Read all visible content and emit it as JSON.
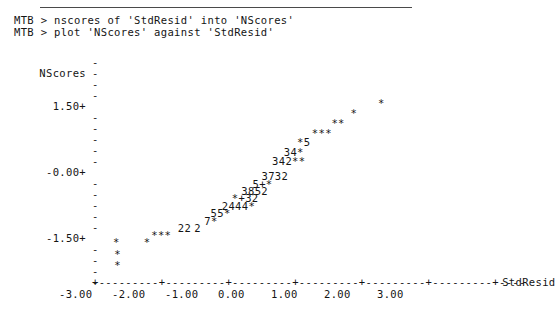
{
  "window": {
    "app": "minitab-session",
    "background": "#ffffff",
    "foreground": "#141414"
  },
  "session": {
    "prompt": "MTB >",
    "commands": [
      "MTB > nscores of 'StdResid' into 'NScores'",
      "MTB > plot 'NScores' against 'StdResid'"
    ]
  },
  "chart_data": {
    "type": "scatter",
    "title": "",
    "subtitle": "",
    "xlabel": "StdResid",
    "ylabel": "NScores",
    "grid": false,
    "legend": null,
    "xlim": [
      -3.0,
      3.5
    ],
    "ylim": [
      -2.4,
      2.5
    ],
    "xticks": [
      "-3.00",
      "-2.00",
      "-1.00",
      "0.00",
      "1.00",
      "2.00",
      "3.00"
    ],
    "xtick_values": [
      -3.0,
      -2.0,
      -1.0,
      0.0,
      1.0,
      2.0,
      3.0
    ],
    "yticks": [
      "1.50+",
      "-0.00+",
      "-1.50+"
    ],
    "ytick_values": [
      1.5,
      0.0,
      -1.5
    ],
    "y_minor_tick_glyph": "-",
    "x_axis_tick_glyph": "+",
    "x_axis_fill_glyph": "-",
    "point_glyph": "*",
    "overplot_note": "digits indicate number of coincident points; '+' indicates 10 or more",
    "markers": [
      {
        "label": "*",
        "x": -2.28,
        "y": -2.25
      },
      {
        "label": "*",
        "x": -2.28,
        "y": -2.0
      },
      {
        "label": "*",
        "x": -2.3,
        "y": -1.73
      },
      {
        "label": "*",
        "x": -1.72,
        "y": -1.73
      },
      {
        "label": "***",
        "x": -1.58,
        "y": -1.56
      },
      {
        "label": "22",
        "x": -1.08,
        "y": -1.4
      },
      {
        "label": "2",
        "x": -0.77,
        "y": -1.4
      },
      {
        "label": "7*",
        "x": -0.58,
        "y": -1.22
      },
      {
        "label": "55*",
        "x": -0.46,
        "y": -1.05
      },
      {
        "label": "2444*",
        "x": -0.25,
        "y": -0.87
      },
      {
        "label": "*+32",
        "x": -0.06,
        "y": -0.7
      },
      {
        "label": "3852",
        "x": 0.12,
        "y": -0.52
      },
      {
        "label": "5+*",
        "x": 0.33,
        "y": -0.35
      },
      {
        "label": "3732",
        "x": 0.5,
        "y": -0.17
      },
      {
        "label": "342**",
        "x": 0.7,
        "y": 0.18
      },
      {
        "label": "34*",
        "x": 0.92,
        "y": 0.4
      },
      {
        "label": "*5",
        "x": 1.17,
        "y": 0.62
      },
      {
        "label": "***",
        "x": 1.45,
        "y": 0.84
      },
      {
        "label": "**",
        "x": 1.82,
        "y": 1.08
      },
      {
        "label": "*",
        "x": 2.18,
        "y": 1.3
      },
      {
        "label": "*",
        "x": 2.7,
        "y": 1.55
      }
    ]
  },
  "plot_rows": [
    {
      "ytick": "",
      "tick_glyph": "-",
      "content": ""
    },
    {
      "ytick": "NScores",
      "tick_glyph": "-",
      "content": ""
    },
    {
      "ytick": "",
      "tick_glyph": "-",
      "content": ""
    },
    {
      "ytick": "",
      "tick_glyph": "-",
      "content": ""
    },
    {
      "ytick": "1.50+",
      "tick_glyph": "",
      "content": ""
    },
    {
      "ytick": "",
      "tick_glyph": "-",
      "content": ""
    },
    {
      "ytick": "",
      "tick_glyph": "-",
      "content": ""
    },
    {
      "ytick": "",
      "tick_glyph": "-",
      "content": ""
    },
    {
      "ytick": "",
      "tick_glyph": "-",
      "content": ""
    },
    {
      "ytick": "",
      "tick_glyph": "-",
      "content": ""
    },
    {
      "ytick": "-0.00+",
      "tick_glyph": "",
      "content": ""
    },
    {
      "ytick": "",
      "tick_glyph": "-",
      "content": ""
    },
    {
      "ytick": "",
      "tick_glyph": "-",
      "content": ""
    },
    {
      "ytick": "",
      "tick_glyph": "-",
      "content": ""
    },
    {
      "ytick": "",
      "tick_glyph": "-",
      "content": ""
    },
    {
      "ytick": "",
      "tick_glyph": "-",
      "content": ""
    },
    {
      "ytick": "-1.50+",
      "tick_glyph": "",
      "content": ""
    },
    {
      "ytick": "",
      "tick_glyph": "-",
      "content": ""
    },
    {
      "ytick": "",
      "tick_glyph": "-",
      "content": ""
    },
    {
      "ytick": "",
      "tick_glyph": "-",
      "content": ""
    },
    {
      "ytick": "",
      "tick_glyph": "-",
      "content": ""
    }
  ],
  "axis": {
    "xaxis_render": "+---------+---------+---------+---------+---------+---------+----",
    "xlabel_suffix": "StdResid",
    "xtick_row": " -3.00     -2.00     -1.00      0.00      1.00      2.00      3.00"
  }
}
